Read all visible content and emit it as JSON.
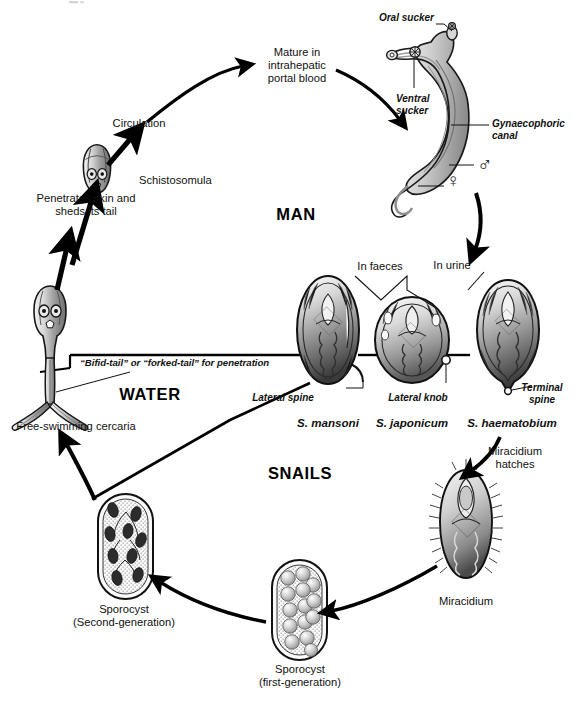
{
  "diagram": {
    "background": "#ffffff",
    "ink": "#111111"
  },
  "zones": [
    {
      "name": "man",
      "label": "MAN",
      "x": 296,
      "y": 212
    },
    {
      "name": "water",
      "label": "WATER",
      "x": 150,
      "y": 392
    },
    {
      "name": "snails",
      "label": "SNAILS",
      "x": 300,
      "y": 472
    }
  ],
  "stages": [
    {
      "id": "schistosomula",
      "label": "Schistosomula",
      "x": 140,
      "y": 180,
      "align": "left"
    },
    {
      "id": "circulation",
      "label": "Circulation",
      "x": 139,
      "y": 122,
      "align": "center"
    },
    {
      "id": "mature-portal-blood",
      "label": "Mature in\nintrahepatic\nportal blood",
      "x": 297,
      "y": 53,
      "align": "center"
    },
    {
      "id": "penetrates-skin",
      "label": "Penetrates skin and\nsheds its tail",
      "x": 86,
      "y": 222,
      "align": "center"
    },
    {
      "id": "free-swimming-cercaria",
      "label": "Free-swimming cercaria",
      "x": 76,
      "y": 423,
      "align": "center"
    },
    {
      "id": "sporocyst-second-generation",
      "label": "Sporocyst\n(Second-generation)",
      "x": 124,
      "y": 596,
      "align": "center"
    },
    {
      "id": "sporocyst-first-generation",
      "label": "Sporocyst\n(first-generation)",
      "x": 300,
      "y": 665,
      "align": "center"
    },
    {
      "id": "miracidium",
      "label": "Miracidium",
      "x": 466,
      "y": 596,
      "align": "center"
    },
    {
      "id": "miracidium-hatches",
      "label": "Miracidium\nhatches",
      "x": 512,
      "y": 450,
      "align": "center"
    }
  ],
  "eggs": [
    {
      "id": "s-mansoni",
      "species": "S. mansoni",
      "species_x": 328,
      "species_y": 418,
      "feature": "Lateral spine",
      "feature_x": 346,
      "feature_y": 394,
      "route": "In faeces"
    },
    {
      "id": "s-japonicum",
      "species": "S. japonicum",
      "species_x": 412,
      "species_y": 418,
      "feature": "Lateral knob",
      "feature_x": 437,
      "feature_y": 394,
      "route": "In faeces"
    },
    {
      "id": "s-haematobium",
      "species": "S. haematobium",
      "species_x": 515,
      "species_y": 418,
      "feature": "Terminal\nspine",
      "feature_x": 518,
      "feature_y": 386,
      "route": "In urine"
    }
  ],
  "routes": [
    {
      "id": "in-faeces",
      "label": "In faeces",
      "x": 380,
      "y": 265
    },
    {
      "id": "in-urine",
      "label": "In urine",
      "x": 452,
      "y": 264
    }
  ],
  "worm_annotations": [
    {
      "id": "oral-sucker",
      "label": "Oral sucker",
      "x": 432,
      "y": 16,
      "align": "right"
    },
    {
      "id": "ventral-sucker",
      "label": "Ventral\nsucker",
      "x": 404,
      "y": 96,
      "align": "left"
    },
    {
      "id": "gynaecophoric-canal",
      "label": "Gynaecophoric\ncanal",
      "x": 494,
      "y": 119,
      "align": "left"
    },
    {
      "id": "male-symbol",
      "label": "♂",
      "x": 483,
      "y": 165,
      "align": "left"
    },
    {
      "id": "female-symbol",
      "label": "♀",
      "x": 451,
      "y": 180,
      "align": "left"
    }
  ],
  "cercaria_note": {
    "id": "bifid-tail-note",
    "label": "“Bifid-tail” or “forked-tail” for penetration",
    "x": 80,
    "y": 355
  }
}
